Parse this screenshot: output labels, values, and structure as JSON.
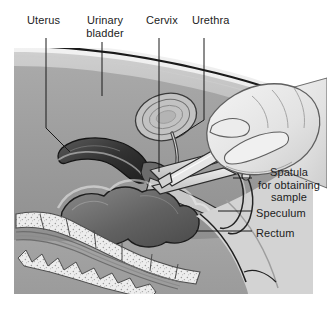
{
  "figure": {
    "type": "medical-illustration",
    "style": "grayscale line-and-tone anatomical drawing",
    "background_color": "#ffffff",
    "text_color": "#1c1c1c",
    "leader_line_color": "#1a1a1a"
  },
  "labels": {
    "top": [
      {
        "id": "uterus",
        "text": "Uterus"
      },
      {
        "id": "bladder",
        "text": "Urinary\nbladder"
      },
      {
        "id": "cervix",
        "text": "Cervix"
      },
      {
        "id": "urethra",
        "text": "Urethra"
      }
    ],
    "right": [
      {
        "id": "spatula",
        "text": "Spatula\nfor obtaining\nsample"
      },
      {
        "id": "speculum",
        "text": "Speculum"
      },
      {
        "id": "rectum",
        "text": "Rectum"
      }
    ]
  },
  "structures": [
    "uterus",
    "urinary bladder",
    "cervix",
    "urethra",
    "rectum",
    "vagina",
    "sacrum",
    "vertebrae",
    "speculum",
    "spatula",
    "clinician hand"
  ],
  "palette": {
    "body_light": "#d9d9d9",
    "body_mid": "#b6b6b6",
    "body_dark": "#8e8e8e",
    "organ_dark": "#4a4a4a",
    "organ_darkest": "#2b2b2b",
    "bone_fill": "#ededed",
    "instrument": "#cfcfcf",
    "hand_light": "#e4e4e4",
    "outline": "#1a1a1a"
  }
}
